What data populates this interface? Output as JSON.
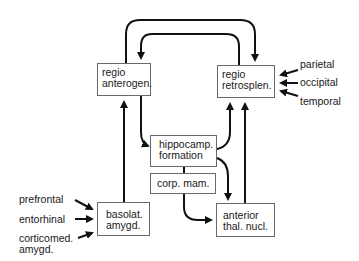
{
  "diagram": {
    "nodes": {
      "regio_anterogen": {
        "line1": "regio",
        "line2": "anterogen."
      },
      "regio_retrosplen": {
        "line1": "regio",
        "line2": "retrosplen."
      },
      "hippocamp_formation": {
        "line1": "hippocamp.",
        "line2": "formation"
      },
      "corp_mam": {
        "line1": "corp. mam."
      },
      "basolat_amygd": {
        "line1": "basolat.",
        "line2": "amygd."
      },
      "anterior_thal_nucl": {
        "line1": "anterior",
        "line2": "thal. nucl."
      }
    },
    "inputs_right": [
      "parietal",
      "occipital",
      "temporal"
    ],
    "inputs_left": {
      "prefrontal": "prefrontal",
      "entorhinal": "entorhinal",
      "corticomed_line1": "corticomed.",
      "corticomed_line2": "amygd."
    },
    "edges": [
      {
        "from": "regio anterogen.",
        "to": "regio retrosplen."
      },
      {
        "from": "regio retrosplen.",
        "to": "regio anterogen."
      },
      {
        "from": "regio anterogen.",
        "to": "hippocamp. formation"
      },
      {
        "from": "hippocamp. formation",
        "to": "regio retrosplen."
      },
      {
        "from": "hippocamp. formation",
        "to": "anterior thal. nucl."
      },
      {
        "from": "corp. mam.",
        "to": "anterior thal. nucl."
      },
      {
        "from": "anterior thal. nucl.",
        "to": "regio retrosplen."
      },
      {
        "from": "basolat. amygd.",
        "to": "regio anterogen."
      },
      {
        "from": "parietal",
        "to": "regio retrosplen."
      },
      {
        "from": "occipital",
        "to": "regio retrosplen."
      },
      {
        "from": "temporal",
        "to": "regio retrosplen."
      },
      {
        "from": "prefrontal",
        "to": "basolat. amygd."
      },
      {
        "from": "entorhinal",
        "to": "basolat. amygd."
      },
      {
        "from": "corticomed. amygd.",
        "to": "basolat. amygd."
      }
    ],
    "colors": {
      "line": "#111111",
      "box_border": "#6a6a6a",
      "text": "#1a1a1a"
    }
  }
}
